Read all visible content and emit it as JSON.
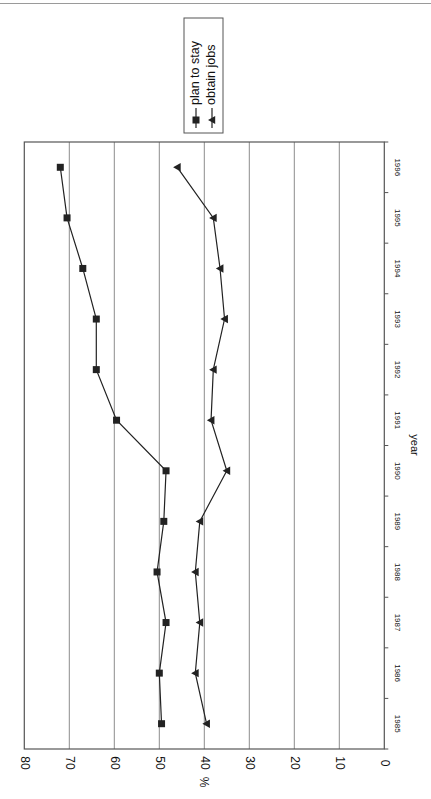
{
  "chart_data": {
    "type": "line",
    "orientation": "rotated-90-clockwise",
    "title": "",
    "xlabel": "year",
    "ylabel": "%",
    "categories": [
      "1985",
      "1986",
      "1987",
      "1988",
      "1989",
      "1990",
      "1991",
      "1992",
      "1993",
      "1994",
      "1995",
      "1996"
    ],
    "series": [
      {
        "name": "plan to stay",
        "marker": "square",
        "values": [
          49.5,
          50,
          48.5,
          50.5,
          49,
          48.5,
          59.5,
          64,
          64,
          67,
          70.5,
          72
        ]
      },
      {
        "name": "obtain jobs",
        "marker": "triangle",
        "values": [
          39.5,
          42,
          41,
          42,
          41,
          35,
          38.5,
          38,
          35.5,
          36.5,
          38,
          46
        ]
      }
    ],
    "ylim": [
      0,
      80
    ],
    "yticks": [
      0,
      10,
      20,
      30,
      40,
      50,
      60,
      70,
      80
    ],
    "grid": true,
    "legend_position": "top (right of plot in unrotated view)"
  },
  "legend": {
    "items": [
      {
        "label": "plan to stay",
        "marker": "square"
      },
      {
        "label": "obtain jobs",
        "marker": "triangle"
      }
    ]
  },
  "axis": {
    "x_label": "year",
    "y_label": "%"
  },
  "colors": {
    "line": "#222222",
    "grid": "#8c8c8c",
    "frame": "#555555"
  }
}
